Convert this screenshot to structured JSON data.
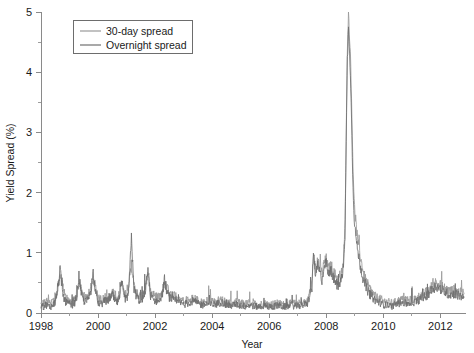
{
  "chart_data": {
    "type": "line",
    "title": "",
    "xlabel": "Year",
    "ylabel": "Yield Spread (%)",
    "xlim": [
      1998.0,
      2012.9
    ],
    "ylim": [
      0,
      5
    ],
    "grid": false,
    "legend_position": "top-left",
    "x_ticks": [
      "1998",
      "2000",
      "2002",
      "2004",
      "2006",
      "2008",
      "2010",
      "2012"
    ],
    "x_tick_values": [
      1998,
      2000,
      2002,
      2004,
      2006,
      2008,
      2010,
      2012
    ],
    "x_minor_tick_values": [
      1999,
      2001,
      2003,
      2005,
      2007,
      2009,
      2011
    ],
    "y_ticks": [
      "0",
      "1",
      "2",
      "3",
      "4",
      "5"
    ],
    "y_tick_values": [
      0,
      1,
      2,
      3,
      4,
      5
    ],
    "y_minor_tick_values": [
      0.5,
      1.5,
      2.5,
      3.5,
      4.5
    ],
    "colors": {
      "series_30day": "#9a9a9a",
      "series_overnight": "#6f6f6f",
      "axis": "#8a8a8a",
      "text": "#1a1a1a"
    },
    "series": [
      {
        "name": "30-day spread",
        "color": "#9a9a9a",
        "x": [
          1998.0,
          1998.08,
          1998.17,
          1998.25,
          1998.33,
          1998.42,
          1998.5,
          1998.58,
          1998.67,
          1998.75,
          1998.83,
          1998.92,
          1999.0,
          1999.08,
          1999.17,
          1999.25,
          1999.33,
          1999.42,
          1999.5,
          1999.58,
          1999.67,
          1999.75,
          1999.83,
          1999.92,
          2000.0,
          2000.08,
          2000.17,
          2000.25,
          2000.33,
          2000.42,
          2000.5,
          2000.58,
          2000.67,
          2000.75,
          2000.83,
          2000.92,
          2001.0,
          2001.08,
          2001.17,
          2001.25,
          2001.33,
          2001.42,
          2001.5,
          2001.58,
          2001.67,
          2001.75,
          2001.83,
          2001.92,
          2002.0,
          2002.08,
          2002.17,
          2002.25,
          2002.33,
          2002.42,
          2002.5,
          2002.58,
          2002.67,
          2002.75,
          2002.83,
          2002.92,
          2003.0,
          2003.17,
          2003.33,
          2003.5,
          2003.67,
          2003.83,
          2004.0,
          2004.17,
          2004.33,
          2004.5,
          2004.67,
          2004.83,
          2005.0,
          2005.17,
          2005.33,
          2005.5,
          2005.67,
          2005.83,
          2006.0,
          2006.17,
          2006.33,
          2006.5,
          2006.67,
          2006.83,
          2007.0,
          2007.17,
          2007.33,
          2007.5,
          2007.55,
          2007.62,
          2007.7,
          2007.78,
          2007.85,
          2007.92,
          2008.0,
          2008.08,
          2008.17,
          2008.25,
          2008.33,
          2008.42,
          2008.5,
          2008.58,
          2008.66,
          2008.7,
          2008.74,
          2008.78,
          2008.82,
          2008.86,
          2008.9,
          2008.94,
          2008.98,
          2009.02,
          2009.08,
          2009.17,
          2009.25,
          2009.33,
          2009.42,
          2009.5,
          2009.58,
          2009.67,
          2009.75,
          2009.83,
          2009.92,
          2010.0,
          2010.17,
          2010.33,
          2010.5,
          2010.67,
          2010.83,
          2011.0,
          2011.17,
          2011.33,
          2011.5,
          2011.67,
          2011.83,
          2012.0,
          2012.17,
          2012.33,
          2012.5,
          2012.67,
          2012.83
        ],
        "y": [
          0.18,
          0.15,
          0.2,
          0.17,
          0.16,
          0.19,
          0.22,
          0.35,
          0.62,
          0.48,
          0.3,
          0.24,
          0.2,
          0.18,
          0.22,
          0.3,
          0.5,
          0.38,
          0.28,
          0.24,
          0.3,
          0.42,
          0.55,
          0.4,
          0.25,
          0.2,
          0.22,
          0.26,
          0.24,
          0.3,
          0.35,
          0.28,
          0.24,
          0.3,
          0.45,
          0.34,
          0.3,
          0.42,
          0.8,
          0.5,
          0.36,
          0.3,
          0.28,
          0.32,
          0.45,
          0.62,
          0.4,
          0.3,
          0.28,
          0.26,
          0.3,
          0.35,
          0.5,
          0.42,
          0.34,
          0.3,
          0.28,
          0.26,
          0.24,
          0.22,
          0.2,
          0.22,
          0.25,
          0.2,
          0.18,
          0.2,
          0.18,
          0.2,
          0.22,
          0.18,
          0.16,
          0.18,
          0.16,
          0.15,
          0.17,
          0.15,
          0.14,
          0.16,
          0.14,
          0.15,
          0.16,
          0.14,
          0.15,
          0.16,
          0.15,
          0.17,
          0.18,
          0.5,
          0.95,
          0.72,
          0.85,
          0.78,
          0.66,
          0.82,
          0.9,
          0.72,
          0.8,
          0.68,
          0.62,
          0.56,
          0.62,
          0.72,
          1.5,
          3.0,
          4.4,
          4.95,
          4.6,
          4.1,
          3.2,
          2.4,
          1.9,
          1.6,
          1.3,
          1.0,
          0.8,
          0.62,
          0.5,
          0.42,
          0.36,
          0.3,
          0.26,
          0.24,
          0.22,
          0.2,
          0.18,
          0.16,
          0.2,
          0.22,
          0.2,
          0.22,
          0.24,
          0.3,
          0.34,
          0.42,
          0.5,
          0.46,
          0.4,
          0.36,
          0.38,
          0.34,
          0.32
        ]
      },
      {
        "name": "Overnight spread",
        "color": "#6f6f6f",
        "x": [
          1998.0,
          1998.08,
          1998.17,
          1998.25,
          1998.33,
          1998.42,
          1998.5,
          1998.58,
          1998.67,
          1998.75,
          1998.83,
          1998.92,
          1999.0,
          1999.08,
          1999.17,
          1999.25,
          1999.33,
          1999.42,
          1999.5,
          1999.58,
          1999.67,
          1999.75,
          1999.83,
          1999.92,
          2000.0,
          2000.08,
          2000.17,
          2000.25,
          2000.33,
          2000.42,
          2000.5,
          2000.58,
          2000.67,
          2000.75,
          2000.83,
          2000.92,
          2001.0,
          2001.08,
          2001.17,
          2001.25,
          2001.33,
          2001.42,
          2001.5,
          2001.58,
          2001.67,
          2001.75,
          2001.83,
          2001.92,
          2002.0,
          2002.08,
          2002.17,
          2002.25,
          2002.33,
          2002.42,
          2002.5,
          2002.58,
          2002.67,
          2002.75,
          2002.83,
          2002.92,
          2003.0,
          2003.17,
          2003.33,
          2003.5,
          2003.67,
          2003.83,
          2004.0,
          2004.17,
          2004.33,
          2004.5,
          2004.67,
          2004.83,
          2005.0,
          2005.17,
          2005.33,
          2005.5,
          2005.67,
          2005.83,
          2006.0,
          2006.17,
          2006.33,
          2006.5,
          2006.67,
          2006.83,
          2007.0,
          2007.17,
          2007.33,
          2007.5,
          2007.55,
          2007.62,
          2007.7,
          2007.78,
          2007.85,
          2007.92,
          2008.0,
          2008.08,
          2008.17,
          2008.25,
          2008.33,
          2008.42,
          2008.5,
          2008.58,
          2008.66,
          2008.7,
          2008.74,
          2008.78,
          2008.82,
          2008.86,
          2008.9,
          2008.94,
          2008.98,
          2009.02,
          2009.08,
          2009.17,
          2009.25,
          2009.33,
          2009.42,
          2009.5,
          2009.58,
          2009.67,
          2009.75,
          2009.83,
          2009.92,
          2010.0,
          2010.17,
          2010.33,
          2010.5,
          2010.67,
          2010.83,
          2011.0,
          2011.17,
          2011.33,
          2011.5,
          2011.67,
          2011.83,
          2012.0,
          2012.17,
          2012.33,
          2012.5,
          2012.67,
          2012.83
        ],
        "y": [
          0.12,
          0.1,
          0.14,
          0.11,
          0.1,
          0.13,
          0.18,
          0.4,
          0.72,
          0.35,
          0.2,
          0.16,
          0.14,
          0.12,
          0.16,
          0.25,
          0.62,
          0.3,
          0.2,
          0.18,
          0.24,
          0.38,
          0.68,
          0.3,
          0.18,
          0.14,
          0.16,
          0.2,
          0.18,
          0.26,
          0.3,
          0.2,
          0.17,
          0.24,
          0.5,
          0.26,
          0.22,
          0.36,
          1.3,
          0.42,
          0.3,
          0.22,
          0.2,
          0.26,
          0.4,
          0.72,
          0.3,
          0.22,
          0.2,
          0.18,
          0.24,
          0.3,
          0.55,
          0.34,
          0.26,
          0.22,
          0.2,
          0.18,
          0.17,
          0.16,
          0.14,
          0.16,
          0.2,
          0.15,
          0.13,
          0.15,
          0.13,
          0.15,
          0.18,
          0.13,
          0.12,
          0.14,
          0.12,
          0.11,
          0.13,
          0.11,
          0.1,
          0.12,
          0.1,
          0.11,
          0.12,
          0.1,
          0.11,
          0.12,
          0.11,
          0.13,
          0.14,
          0.4,
          1.05,
          0.6,
          0.78,
          0.66,
          0.55,
          0.74,
          0.84,
          0.6,
          0.72,
          0.56,
          0.5,
          0.44,
          0.52,
          0.64,
          1.3,
          2.8,
          4.2,
          4.7,
          4.35,
          3.8,
          2.9,
          2.1,
          1.6,
          1.35,
          1.1,
          0.85,
          0.65,
          0.5,
          0.4,
          0.33,
          0.28,
          0.23,
          0.2,
          0.18,
          0.16,
          0.14,
          0.12,
          0.11,
          0.15,
          0.17,
          0.15,
          0.17,
          0.19,
          0.24,
          0.28,
          0.36,
          0.44,
          0.4,
          0.34,
          0.3,
          0.32,
          0.28,
          0.26
        ]
      }
    ]
  },
  "legend": {
    "entries": [
      {
        "label": "30-day spread"
      },
      {
        "label": "Overnight spread"
      }
    ]
  }
}
